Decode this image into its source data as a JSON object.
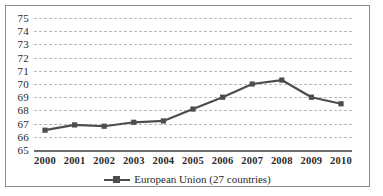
{
  "chart_data": {
    "type": "line",
    "title": "",
    "subtitle": "",
    "xlabel": "",
    "ylabel": "",
    "categories": [
      "2000",
      "2001",
      "2002",
      "2003",
      "2004",
      "2005",
      "2006",
      "2007",
      "2008",
      "2009",
      "2010"
    ],
    "x": [
      2000,
      2001,
      2002,
      2003,
      2004,
      2005,
      2006,
      2007,
      2008,
      2009,
      2010
    ],
    "series": [
      {
        "name": "European Union (27 countries)",
        "values": [
          66.5,
          66.9,
          66.8,
          67.1,
          67.2,
          68.1,
          69.0,
          70.0,
          70.3,
          69.0,
          68.5
        ],
        "color": "#4d4d4d",
        "marker": "square"
      }
    ],
    "ylim": [
      65,
      75
    ],
    "yticks": [
      65,
      66,
      67,
      68,
      69,
      70,
      71,
      72,
      73,
      74,
      75
    ],
    "ytick_labels": [
      "65",
      "66",
      "67",
      "68",
      "69",
      "70",
      "71",
      "72",
      "73",
      "74",
      "75"
    ],
    "grid": true,
    "grid_style": "dashed",
    "grid_color": "#b9b9b9",
    "legend_position": "bottom",
    "legend": [
      "European Union (27 countries)"
    ],
    "border_color": "#8c8c8c",
    "axis_color": "#6d6d6d",
    "background": "#ffffff"
  },
  "legend": {
    "entry_label": "European Union (27 countries)",
    "marker_icon": "line-square-marker-icon"
  }
}
